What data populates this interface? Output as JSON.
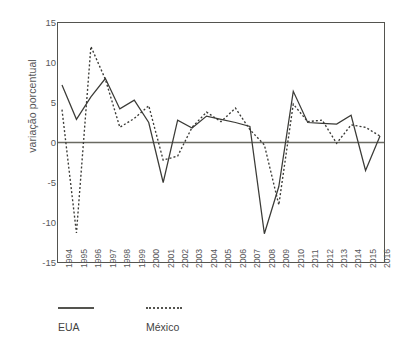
{
  "chart_data": {
    "type": "line",
    "title": "",
    "xlabel": "",
    "ylabel": "variação porcentual",
    "ylim": [
      -15,
      15
    ],
    "yticks": [
      15,
      10,
      5,
      0,
      -5,
      -10,
      -15
    ],
    "ytick_labels": [
      "15",
      "10",
      "5",
      "0",
      "-5",
      "-10",
      "-15"
    ],
    "grid": false,
    "zero_line": true,
    "legend_position": "bottom-left",
    "x": [
      1994,
      1995,
      1996,
      1997,
      1998,
      1999,
      2000,
      2001,
      2002,
      2003,
      2004,
      2005,
      2006,
      2007,
      2008,
      2009,
      2010,
      2011,
      2012,
      2013,
      2014,
      2015,
      2016
    ],
    "categories": [
      "1994",
      "1995",
      "1996",
      "1997",
      "1998",
      "1999",
      "2000",
      "2001",
      "2002",
      "2003",
      "2004",
      "2005",
      "2006",
      "2007",
      "2008",
      "2009",
      "2010",
      "2011",
      "2012",
      "2013",
      "2014",
      "2015",
      "2016"
    ],
    "series": [
      {
        "name": "EUA",
        "style": "solid",
        "color": "#3b3b37",
        "values": [
          7.2,
          2.9,
          5.7,
          8.0,
          4.2,
          5.3,
          2.5,
          -5.0,
          2.8,
          1.8,
          3.3,
          2.9,
          2.5,
          2.0,
          -11.4,
          -5.5,
          6.4,
          2.5,
          2.4,
          2.3,
          3.4,
          -3.5,
          0.8
        ]
      },
      {
        "name": "México",
        "style": "dotted",
        "color": "#3b3b37",
        "values": [
          4.1,
          -11.3,
          12.0,
          7.9,
          1.9,
          3.0,
          4.6,
          -2.2,
          -1.7,
          1.9,
          3.8,
          2.6,
          4.3,
          1.6,
          -0.3,
          -7.8,
          4.8,
          2.6,
          2.8,
          -0.1,
          2.2,
          1.9,
          0.8
        ]
      }
    ]
  },
  "legend": {
    "entries": [
      {
        "label": "EUA"
      },
      {
        "label": "México"
      }
    ]
  },
  "colors": {
    "line": "#3b3b37",
    "axis": "#54544f",
    "text": "#58585a",
    "background": "#ffffff"
  }
}
